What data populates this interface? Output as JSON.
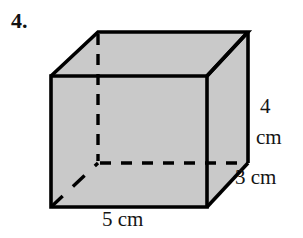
{
  "problem": {
    "number": "4."
  },
  "figure": {
    "name": "rectangular-prism",
    "fill_color": "#c9c9c9",
    "stroke_color": "#000000",
    "labels": {
      "height_value": "4",
      "height_unit": "cm",
      "depth": "3 cm",
      "width": "5 cm"
    },
    "dimensions": {
      "width_cm": 5,
      "depth_cm": 3,
      "height_cm": 4
    },
    "vertices": {
      "front_top_left": [
        51,
        76
      ],
      "front_top_right": [
        207,
        76
      ],
      "front_bottom_right": [
        207,
        207
      ],
      "front_bottom_left": [
        51,
        207
      ],
      "back_top_left": [
        98,
        32
      ],
      "back_top_right": [
        248,
        32
      ],
      "back_bottom_right": [
        248,
        163
      ],
      "back_bottom_left": [
        98,
        163
      ]
    }
  }
}
